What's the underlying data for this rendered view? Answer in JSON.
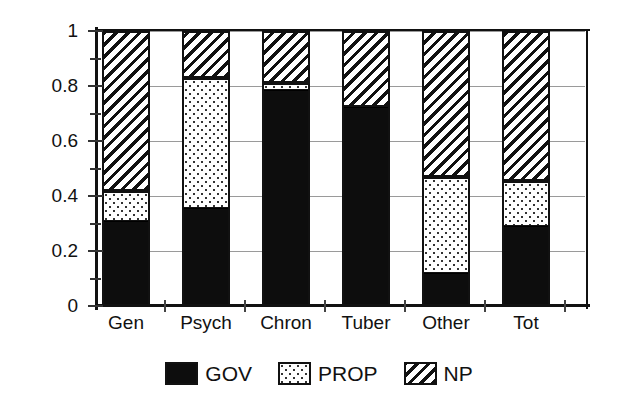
{
  "chart_data": {
    "type": "bar",
    "subtype": "stacked-bar-100-percent",
    "title": "",
    "xlabel": "",
    "ylabel": "",
    "categories": [
      "Gen",
      "Psych",
      "Chron",
      "Tuber",
      "Other",
      "Tot"
    ],
    "series": [
      {
        "name": "GOV",
        "values": [
          0.31,
          0.355,
          0.785,
          0.725,
          0.12,
          0.29
        ]
      },
      {
        "name": "PROP",
        "values": [
          0.11,
          0.475,
          0.025,
          0.0,
          0.35,
          0.165
        ]
      },
      {
        "name": "NP",
        "values": [
          0.58,
          0.17,
          0.19,
          0.275,
          0.53,
          0.545
        ]
      }
    ],
    "cumulative_tops": {
      "GOV": [
        0.31,
        0.355,
        0.785,
        0.725,
        0.12,
        0.29
      ],
      "PROP": [
        0.42,
        0.83,
        0.81,
        0.725,
        0.47,
        0.455
      ],
      "NP": [
        1.0,
        1.0,
        1.0,
        1.0,
        1.0,
        1.0
      ]
    },
    "ylim": [
      0,
      1
    ],
    "yticks": [
      0,
      0.2,
      0.4,
      0.6,
      0.8,
      1
    ],
    "ytick_labels": [
      "0",
      "0.2",
      "0.4",
      "0.6",
      "0.8",
      "1"
    ],
    "yticks_minor": [
      0.1,
      0.3,
      0.5,
      0.7,
      0.9
    ],
    "grid": "horizontal",
    "legend_position": "bottom-center",
    "colors": {
      "GOV": "#0d0d0d",
      "PROP": "#ffffff",
      "NP": "#ffffff",
      "axis": "#111111",
      "gridline": "#9a9a9a",
      "background": "#ffffff"
    },
    "patterns": {
      "GOV": "solid-black",
      "PROP": "dotted-stipple",
      "NP": "diagonal-hatch"
    }
  },
  "legend": {
    "items": [
      {
        "label": "GOV",
        "swatch": "solid-black-swatch"
      },
      {
        "label": "PROP",
        "swatch": "dotted-swatch"
      },
      {
        "label": "NP",
        "swatch": "hatched-swatch"
      }
    ]
  },
  "axis": {
    "y_labels": [
      "1",
      "0.8",
      "0.6",
      "0.4",
      "0.2",
      "0"
    ],
    "x_labels": [
      "Gen",
      "Psych",
      "Chron",
      "Tuber",
      "Other",
      "Tot"
    ]
  }
}
